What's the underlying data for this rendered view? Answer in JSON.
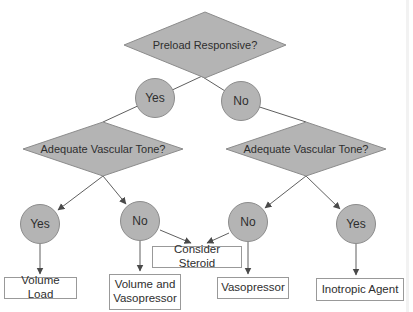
{
  "diagram": {
    "type": "decision-flowchart",
    "nodes": {
      "preload": {
        "shape": "diamond",
        "label": "Preload Responsive?"
      },
      "yes1": {
        "shape": "circle",
        "label": "Yes"
      },
      "no1": {
        "shape": "circle",
        "label": "No"
      },
      "tone_left": {
        "shape": "diamond",
        "label": "Adequate Vascular Tone?"
      },
      "tone_right": {
        "shape": "diamond",
        "label": "Adequate Vascular Tone?"
      },
      "yes2": {
        "shape": "circle",
        "label": "Yes"
      },
      "no2": {
        "shape": "circle",
        "label": "No"
      },
      "no3": {
        "shape": "circle",
        "label": "No"
      },
      "yes3": {
        "shape": "circle",
        "label": "Yes"
      },
      "consider_steroid": {
        "shape": "box",
        "label": "Consider Steroid"
      },
      "volume_load": {
        "shape": "box",
        "label": "Volume Load"
      },
      "volume_vasopressor": {
        "shape": "box",
        "label": "Volume and Vasopressor"
      },
      "vasopressor": {
        "shape": "box",
        "label": "Vasopressor"
      },
      "inotropic": {
        "shape": "box",
        "label": "Inotropic Agent"
      }
    },
    "edges": [
      {
        "from": "preload",
        "to": "yes1",
        "arrow": false
      },
      {
        "from": "preload",
        "to": "no1",
        "arrow": false
      },
      {
        "from": "yes1",
        "to": "tone_left",
        "arrow": false
      },
      {
        "from": "no1",
        "to": "tone_right",
        "arrow": false
      },
      {
        "from": "tone_left",
        "to": "yes2",
        "arrow": true
      },
      {
        "from": "tone_left",
        "to": "no2",
        "arrow": true
      },
      {
        "from": "tone_right",
        "to": "no3",
        "arrow": true
      },
      {
        "from": "tone_right",
        "to": "yes3",
        "arrow": true
      },
      {
        "from": "yes2",
        "to": "volume_load",
        "arrow": true
      },
      {
        "from": "no2",
        "to": "volume_vasopressor",
        "arrow": true
      },
      {
        "from": "no2",
        "to": "consider_steroid",
        "arrow": true
      },
      {
        "from": "no3",
        "to": "consider_steroid",
        "arrow": true
      },
      {
        "from": "no3",
        "to": "vasopressor",
        "arrow": true
      },
      {
        "from": "yes3",
        "to": "inotropic",
        "arrow": true
      }
    ],
    "colors": {
      "shape_fill": "#b4b4b4",
      "shape_border": "#8c8c8c",
      "box_fill": "#ffffff",
      "box_border": "#999999",
      "connector": "#5f5f5f",
      "text": "#2e2e2e",
      "background": "#ffffff"
    }
  }
}
